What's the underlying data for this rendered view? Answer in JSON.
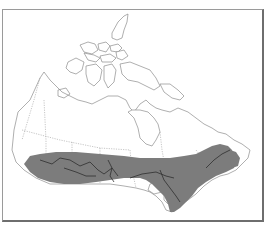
{
  "map": {
    "region": "Canada",
    "type": "range-map",
    "colors": {
      "background": "#ffffff",
      "outline": "#8c8c8c",
      "boundary": "#a0a0a0",
      "range_fill": "#7c7c7c",
      "range_rivers": "#2e2e2e",
      "frame": "#6e6e6e"
    },
    "legend": [],
    "labels": [],
    "shaded_range": {
      "description": "Shaded band across southern Canada from British Columbia coast through the Prairies and southern Ontario/Quebec to the Maritimes"
    }
  }
}
